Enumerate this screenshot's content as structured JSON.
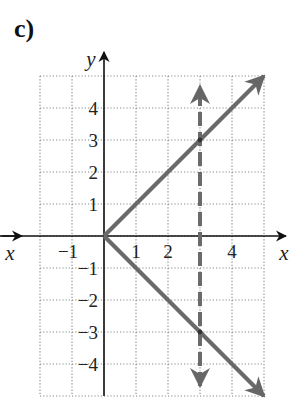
{
  "panel_label": "c)",
  "chart_data": {
    "type": "line",
    "title": "c)",
    "xlabel": "x",
    "ylabel": "y",
    "xlim": [
      -2,
      5
    ],
    "ylim": [
      -5,
      5
    ],
    "grid": true,
    "grid_style": "dotted",
    "x_ticks": [
      -1,
      1,
      2,
      4
    ],
    "x_tick_labels": [
      "−1",
      "1",
      "2",
      "4"
    ],
    "y_ticks": [
      4,
      3,
      2,
      1,
      -1,
      -2,
      -3,
      -4
    ],
    "y_tick_labels": [
      "4",
      "3",
      "2",
      "1",
      "−1",
      "−2",
      "−3",
      "−4"
    ],
    "series": [
      {
        "name": "upper branch y = x",
        "style": "solid",
        "color": "#6a6a6a",
        "x": [
          0,
          5
        ],
        "y": [
          0,
          5
        ],
        "arrow_end": true
      },
      {
        "name": "lower branch y = -x",
        "style": "solid",
        "color": "#6a6a6a",
        "x": [
          0,
          5
        ],
        "y": [
          0,
          -5
        ],
        "arrow_end": true
      },
      {
        "name": "vertical line x = 3",
        "style": "dashed",
        "color": "#6a6a6a",
        "x": [
          3,
          3
        ],
        "y": [
          -5,
          5
        ],
        "arrow_both": true
      }
    ],
    "annotations": [
      {
        "point": [
          3,
          3
        ],
        "note": "intersection of dashed line with upper branch"
      },
      {
        "point": [
          3,
          -3
        ],
        "note": "intersection of dashed line with lower branch"
      }
    ]
  }
}
